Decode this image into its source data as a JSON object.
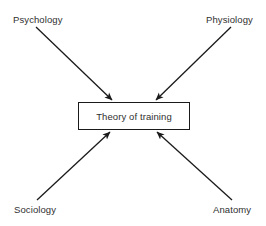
{
  "diagram": {
    "type": "convergent-arrow-diagram",
    "center": {
      "label": "Theory of training",
      "shape": "rectangle",
      "border_color": "#1a1a1a",
      "fill_color": "#ffffff"
    },
    "sources": [
      {
        "id": "psychology",
        "label": "Psychology",
        "position": "top-left"
      },
      {
        "id": "physiology",
        "label": "Physiology",
        "position": "top-right"
      },
      {
        "id": "sociology",
        "label": "Sociology",
        "position": "bottom-left"
      },
      {
        "id": "anatomy",
        "label": "Anatomy",
        "position": "bottom-right"
      }
    ],
    "arrows": [
      {
        "from": "psychology",
        "to": "center",
        "direction": "down-right"
      },
      {
        "from": "physiology",
        "to": "center",
        "direction": "down-left"
      },
      {
        "from": "sociology",
        "to": "center",
        "direction": "up-right"
      },
      {
        "from": "anatomy",
        "to": "center",
        "direction": "up-left"
      }
    ],
    "background_color": "#ffffff",
    "line_color": "#1a1a1a",
    "text_color": "#2f2f2f"
  }
}
